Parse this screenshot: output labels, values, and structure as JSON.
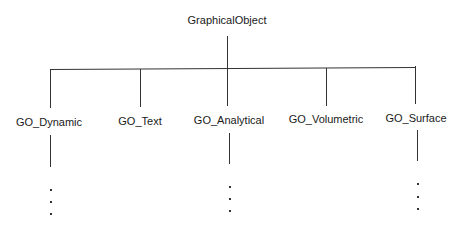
{
  "diagram": {
    "root": {
      "label": "GraphicalObject"
    },
    "children": [
      {
        "label": "GO_Dynamic",
        "has_more": true
      },
      {
        "label": "GO_Text",
        "has_more": false
      },
      {
        "label": "GO_Analytical",
        "has_more": true
      },
      {
        "label": "GO_Volumetric",
        "has_more": false
      },
      {
        "label": "GO_Surface",
        "has_more": true
      }
    ],
    "ellipsis": "..."
  }
}
